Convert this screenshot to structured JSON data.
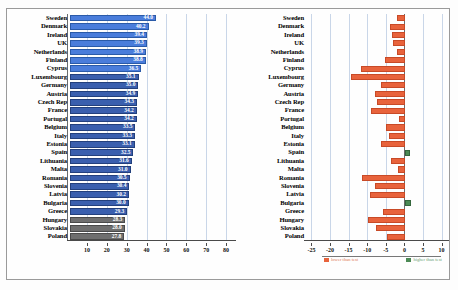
{
  "chart_data": [
    {
      "type": "bar",
      "orientation": "horizontal",
      "title": "",
      "xlabel": "",
      "ylabel": "",
      "xlim": [
        0,
        85
      ],
      "xticks": [
        10,
        20,
        30,
        40,
        50,
        60,
        70,
        80
      ],
      "grid": true,
      "categories": [
        "Sweden",
        "Denmark",
        "Ireland",
        "UK",
        "Netherlands",
        "Finland",
        "Cyprus",
        "Luxembourg",
        "Germany",
        "Austria",
        "Czech Rep",
        "France",
        "Portugal",
        "Belgium",
        "Italy",
        "Estonia",
        "Spain",
        "Lithuania",
        "Malta",
        "Romania",
        "Slovenia",
        "Latvia",
        "Bulgaria",
        "Greece",
        "Hungary",
        "Slovakia",
        "Poland"
      ],
      "values": [
        44.0,
        40.2,
        39.4,
        39.3,
        38.9,
        38.8,
        36.5,
        35.1,
        35.0,
        34.9,
        34.3,
        34.2,
        34.2,
        33.5,
        33.3,
        33.1,
        32.5,
        31.6,
        31.0,
        30.5,
        30.4,
        30.2,
        30.0,
        29.3,
        28.3,
        28.0,
        27.8
      ],
      "value_labels": [
        "44.0",
        "40.2",
        "39.4",
        "39.3",
        "38.9",
        "38.8",
        "36.5",
        "35.1",
        "35.0",
        "34.9",
        "34.3",
        "34.2",
        "34.2",
        "33.5",
        "33.3",
        "33.1",
        "32.5",
        "31.6",
        "31.0",
        "30.5",
        "30.4",
        "30.2",
        "30.0",
        "29.3",
        "28.3",
        "28.0",
        "27.8"
      ],
      "series_colors": {
        "default": "#3a5fae",
        "highlight": "#4a7ddb",
        "dark": "#6f6f6f"
      },
      "highlight_rows": [
        0,
        1,
        2,
        3,
        4,
        5,
        6
      ],
      "dark_rows": [
        24,
        25,
        26
      ]
    },
    {
      "type": "bar",
      "orientation": "horizontal",
      "title": "",
      "xlabel": "",
      "ylabel": "",
      "xlim": [
        -27,
        12
      ],
      "xticks": [
        -25,
        -20,
        -15,
        -10,
        -5,
        0,
        5,
        10
      ],
      "grid": true,
      "zero_line": 0,
      "categories": [
        "Sweden",
        "Denmark",
        "Ireland",
        "UK",
        "Netherlands",
        "Finland",
        "Cyprus",
        "Luxembourg",
        "Germany",
        "Austria",
        "Czech Rep",
        "France",
        "Portugal",
        "Belgium",
        "Italy",
        "Estonia",
        "Spain",
        "Lithuania",
        "Malta",
        "Romania",
        "Slovenia",
        "Latvia",
        "Bulgaria",
        "Greece",
        "Hungary",
        "Slovakia",
        "Poland"
      ],
      "values": [
        -2.4,
        -4.2,
        -3.6,
        -3.4,
        -2.2,
        -5.6,
        -12.2,
        -14.8,
        -6.6,
        -8.2,
        -7.8,
        -9.4,
        -1.6,
        -5.4,
        -4.6,
        -6.8,
        1.2,
        -4.0,
        -2.0,
        -12.0,
        -8.4,
        -9.8,
        1.6,
        -6.2,
        -10.2,
        -8.0,
        -5.0
      ],
      "series_colors": {
        "negative": "#e8633c",
        "positive": "#4c8a55"
      },
      "legend": [
        {
          "label": "lower than test",
          "color": "#e8633c"
        },
        {
          "label": "higher than test",
          "color": "#4c8a55"
        }
      ],
      "legend_position": "bottom"
    }
  ],
  "left_chart": {
    "name": "country-score-bar-chart",
    "xticks": [
      "10",
      "20",
      "30",
      "40",
      "50",
      "60",
      "70",
      "80"
    ]
  },
  "right_chart": {
    "name": "country-difference-bar-chart",
    "xticks": [
      "-25",
      "-20",
      "-15",
      "-10",
      "-5",
      "0",
      "5",
      "10"
    ],
    "legend_neg": "lower than test",
    "legend_pos": "higher than test"
  }
}
